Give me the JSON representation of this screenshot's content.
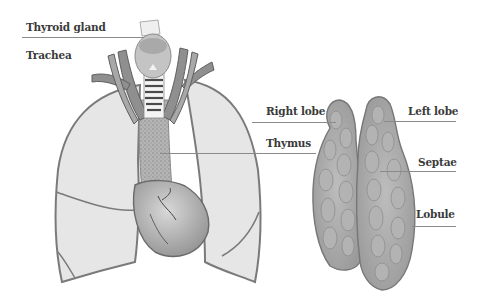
{
  "diagram": {
    "panels": [
      {
        "name": "thoracic-view",
        "description": "Lungs, heart, trachea, thyroid gland and thymus"
      },
      {
        "name": "isolated-thymus",
        "description": "Thymus with right and left lobes, septae and lobules"
      }
    ],
    "labels": {
      "thyroid_gland": "Thyroid gland",
      "trachea": "Trachea",
      "right_lobe": "Right lobe",
      "left_lobe": "Left lobe",
      "thymus": "Thymus",
      "septae": "Septae",
      "lobule": "Lobule"
    },
    "colors": {
      "background": "#ffffff",
      "lung_fill": "#e6e6e6",
      "outline": "#7a7a7a",
      "organ_dark": "#9c9c9c",
      "label_text": "#3a3a3a",
      "leader_line": "#8a8a8a"
    }
  }
}
